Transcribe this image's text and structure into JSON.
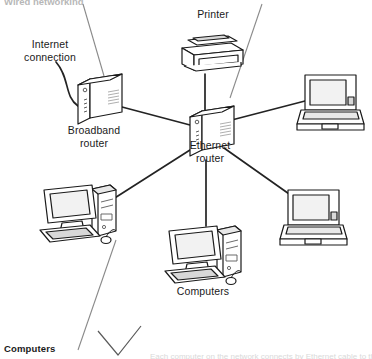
{
  "diagram": {
    "title_clipped_top": "Wired networking",
    "caption_clipped_bottom": "Each computer on the network connects by Ethernet cable to the router",
    "labels": {
      "internet_connection": "Internet\nconnection",
      "broadband_router": "Broadband\nrouter",
      "printer": "Printer",
      "ethernet_router": "Ethernet\nrouter",
      "computers_middle": "Computers",
      "computers_callout": "Computers"
    },
    "colors": {
      "stroke": "#1a1a1a",
      "link": "#232323",
      "leader": "#8a8a8a",
      "fill": "#ffffff",
      "shade": "#d8d8d8",
      "screen": "#f2f2f2"
    },
    "nodes": [
      {
        "id": "broadband-router",
        "type": "router",
        "label": "Broadband router",
        "x": 98,
        "y": 100
      },
      {
        "id": "ethernet-router",
        "type": "router",
        "label": "Ethernet router",
        "x": 206,
        "y": 130
      },
      {
        "id": "printer",
        "type": "printer",
        "label": "Printer",
        "x": 208,
        "y": 47
      },
      {
        "id": "laptop-top-right",
        "type": "laptop",
        "label": "",
        "x": 331,
        "y": 97
      },
      {
        "id": "laptop-bottom-right",
        "type": "laptop",
        "label": "",
        "x": 314,
        "y": 213
      },
      {
        "id": "desktop-left",
        "type": "desktop",
        "label": "",
        "x": 78,
        "y": 212
      },
      {
        "id": "desktop-center",
        "type": "desktop",
        "label": "Computers",
        "x": 205,
        "y": 253
      }
    ],
    "links": [
      {
        "from": "ethernet-router",
        "to": "printer"
      },
      {
        "from": "ethernet-router",
        "to": "broadband-router"
      },
      {
        "from": "ethernet-router",
        "to": "laptop-top-right"
      },
      {
        "from": "ethernet-router",
        "to": "laptop-bottom-right"
      },
      {
        "from": "ethernet-router",
        "to": "desktop-left"
      },
      {
        "from": "ethernet-router",
        "to": "desktop-center"
      },
      {
        "from": "internet",
        "to": "broadband-router"
      }
    ]
  }
}
